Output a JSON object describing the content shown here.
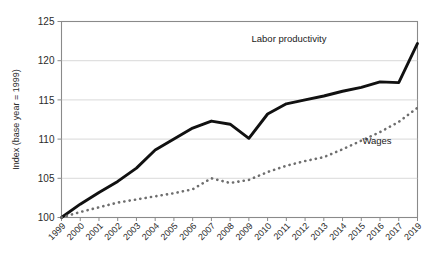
{
  "chart_data": {
    "type": "line",
    "title": "",
    "xlabel": "",
    "ylabel": "Index (base year = 1999)",
    "ylim": [
      100,
      125
    ],
    "yticks": [
      100,
      105,
      110,
      115,
      120,
      125
    ],
    "grid": true,
    "legend_position": "inline-annotations",
    "categories": [
      "1999",
      "2000",
      "2001",
      "2002",
      "2003",
      "2004",
      "2005",
      "2006",
      "2007",
      "2008",
      "2009",
      "2010",
      "2011",
      "2012",
      "2013",
      "2014",
      "2015",
      "2016",
      "2017",
      "2019"
    ],
    "series": [
      {
        "name": "Labor productivity",
        "style": "solid",
        "color": "#111111",
        "values": [
          100.0,
          101.7,
          103.2,
          104.6,
          106.3,
          108.6,
          110.0,
          111.4,
          112.3,
          111.9,
          110.1,
          113.2,
          114.5,
          115.0,
          115.5,
          116.1,
          116.6,
          117.3,
          117.2,
          122.2
        ]
      },
      {
        "name": "Wages",
        "style": "dotted",
        "color": "#6e6e6e",
        "values": [
          100.0,
          100.7,
          101.3,
          101.9,
          102.3,
          102.7,
          103.1,
          103.6,
          105.0,
          104.4,
          104.8,
          105.8,
          106.6,
          107.2,
          107.7,
          108.7,
          109.8,
          110.9,
          112.2,
          114.0
        ]
      }
    ],
    "annotations": [
      {
        "text": "Labor productivity",
        "x_px": 289,
        "y_px": 42
      },
      {
        "text": "Wages",
        "x_px": 377,
        "y_px": 144
      }
    ]
  }
}
